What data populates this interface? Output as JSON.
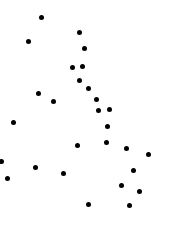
{
  "canvas": {
    "width": 169,
    "height": 230,
    "background_color": "#ffffff"
  },
  "chart_data": {
    "type": "scatter",
    "title": "",
    "subtitle": "",
    "xlabel": "",
    "ylabel": "",
    "xlim": [
      0,
      169
    ],
    "ylim": [
      0,
      230
    ],
    "grid": false,
    "axes_visible": false,
    "legend": null,
    "marker": {
      "shape": "circle",
      "color": "#000000",
      "diameter_px": 5
    },
    "point_count": 30,
    "points": [
      {
        "x": 41,
        "y": 17
      },
      {
        "x": 28,
        "y": 41
      },
      {
        "x": 79,
        "y": 32
      },
      {
        "x": 84,
        "y": 48
      },
      {
        "x": 72,
        "y": 67
      },
      {
        "x": 82,
        "y": 66
      },
      {
        "x": 79,
        "y": 80
      },
      {
        "x": 88,
        "y": 88
      },
      {
        "x": 38,
        "y": 93
      },
      {
        "x": 53,
        "y": 101
      },
      {
        "x": 96,
        "y": 99
      },
      {
        "x": 98,
        "y": 110
      },
      {
        "x": 109,
        "y": 109
      },
      {
        "x": 13,
        "y": 122
      },
      {
        "x": 107,
        "y": 126
      },
      {
        "x": 106,
        "y": 142
      },
      {
        "x": 77,
        "y": 145
      },
      {
        "x": 126,
        "y": 148
      },
      {
        "x": 148,
        "y": 154
      },
      {
        "x": 1,
        "y": 161
      },
      {
        "x": 35,
        "y": 167
      },
      {
        "x": 133,
        "y": 170
      },
      {
        "x": 63,
        "y": 173
      },
      {
        "x": 7,
        "y": 178
      },
      {
        "x": 121,
        "y": 185
      },
      {
        "x": 139,
        "y": 191
      },
      {
        "x": 88,
        "y": 204
      },
      {
        "x": 129,
        "y": 205
      }
    ]
  }
}
